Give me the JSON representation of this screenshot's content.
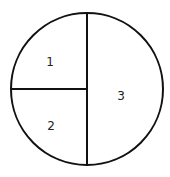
{
  "diagram": {
    "shape": "circle",
    "circle": {
      "cx": 87,
      "cy": 89,
      "r": 76
    },
    "stroke_color": "#111111",
    "divider_vertical": {
      "x": 87,
      "y1": 13,
      "y2": 165
    },
    "divider_horizontal": {
      "x1": 11,
      "x2": 87,
      "y": 89
    },
    "regions": [
      {
        "label": "1",
        "x": 50,
        "y": 62
      },
      {
        "label": "2",
        "x": 51,
        "y": 126
      },
      {
        "label": "3",
        "x": 121,
        "y": 96
      }
    ]
  }
}
